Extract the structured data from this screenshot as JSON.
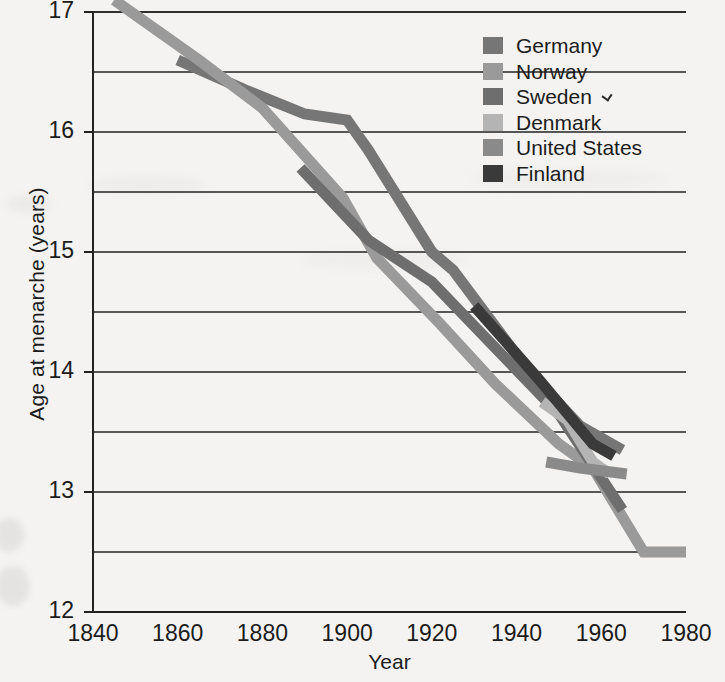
{
  "chart_data": {
    "type": "line",
    "title": "",
    "xlabel": "Year",
    "ylabel": "Age at menarche (years)",
    "xlim": [
      1840,
      1980
    ],
    "ylim": [
      12,
      17
    ],
    "xticks": [
      1840,
      1860,
      1880,
      1900,
      1920,
      1940,
      1960,
      1980
    ],
    "yticks": [
      12,
      13,
      14,
      15,
      16,
      17
    ],
    "grid": "horizontal gridlines every 0.5 years",
    "legend_position": "top-right inside plot",
    "series": [
      {
        "name": "Germany",
        "color": "#767676",
        "points": [
          [
            1860,
            16.6
          ],
          [
            1876,
            16.35
          ],
          [
            1890,
            16.15
          ],
          [
            1900,
            16.1
          ],
          [
            1905,
            15.85
          ],
          [
            1920,
            15.0
          ],
          [
            1925,
            14.85
          ],
          [
            1943,
            14.0
          ],
          [
            1955,
            13.55
          ],
          [
            1965,
            13.35
          ]
        ]
      },
      {
        "name": "Norway",
        "color": "#9a9a9a",
        "points": [
          [
            1845,
            17.1
          ],
          [
            1865,
            16.6
          ],
          [
            1880,
            16.2
          ],
          [
            1899,
            15.45
          ],
          [
            1907,
            14.95
          ],
          [
            1922,
            14.4
          ],
          [
            1935,
            13.9
          ],
          [
            1950,
            13.4
          ],
          [
            1958,
            13.2
          ],
          [
            1970,
            12.5
          ],
          [
            1980,
            12.5
          ]
        ]
      },
      {
        "name": "Sweden",
        "color": "#6e6e6e",
        "points": [
          [
            1889,
            15.7
          ],
          [
            1905,
            15.1
          ],
          [
            1920,
            14.75
          ],
          [
            1935,
            14.2
          ],
          [
            1950,
            13.65
          ],
          [
            1965,
            12.85
          ]
        ]
      },
      {
        "name": "Denmark",
        "color": "#b4b4b4",
        "points": [
          [
            1946,
            13.75
          ],
          [
            1952,
            13.6
          ],
          [
            1958,
            13.25
          ],
          [
            1962,
            13.15
          ]
        ]
      },
      {
        "name": "United States",
        "color": "#8a8a8a",
        "points": [
          [
            1947,
            13.25
          ],
          [
            1955,
            13.2
          ],
          [
            1966,
            13.15
          ]
        ]
      },
      {
        "name": "Finland",
        "color": "#3a3a3a",
        "points": [
          [
            1930,
            14.55
          ],
          [
            1945,
            13.95
          ],
          [
            1958,
            13.4
          ],
          [
            1963,
            13.3
          ]
        ]
      }
    ]
  },
  "axes": {
    "ylabel": "Age at menarche (years)",
    "xlabel": "Year",
    "yticks": [
      "17",
      "16",
      "15",
      "14",
      "13",
      "12"
    ],
    "xticks": [
      "1840",
      "1860",
      "1880",
      "1900",
      "1920",
      "1940",
      "1960",
      "1980"
    ]
  },
  "legend": {
    "items": [
      {
        "label": "Germany",
        "color": "#767676"
      },
      {
        "label": "Norway",
        "color": "#9a9a9a"
      },
      {
        "label": "Sweden",
        "color": "#6e6e6e"
      },
      {
        "label": "Denmark",
        "color": "#b4b4b4"
      },
      {
        "label": "United States",
        "color": "#8a8a8a"
      },
      {
        "label": "Finland",
        "color": "#3a3a3a"
      }
    ]
  }
}
